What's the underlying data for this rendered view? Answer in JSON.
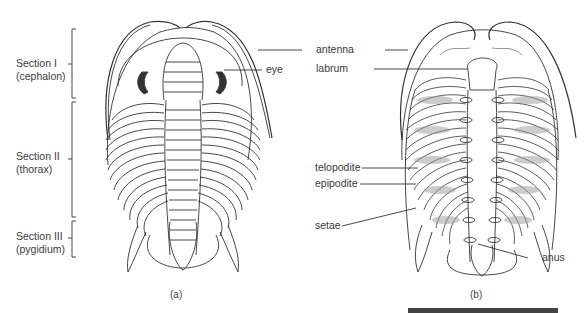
{
  "figure": {
    "panel_a": {
      "caption": "(a)",
      "sections": [
        {
          "title": "Section I",
          "subtitle": "(cephalon)"
        },
        {
          "title": "Section II",
          "subtitle": "(thorax)"
        },
        {
          "title": "Section III",
          "subtitle": "(pygidium)"
        }
      ],
      "labels": {
        "eye": "eye"
      }
    },
    "panel_b": {
      "caption": "(b)",
      "labels": {
        "antenna": "antenna",
        "labrum": "labrum",
        "telopodite": "telopodite",
        "epipodite": "epipodite",
        "setae": "setae",
        "anus": "anus"
      }
    },
    "colors": {
      "line": "#333333",
      "label": "#3a3a3a",
      "shade": "#9a9a9a"
    }
  }
}
